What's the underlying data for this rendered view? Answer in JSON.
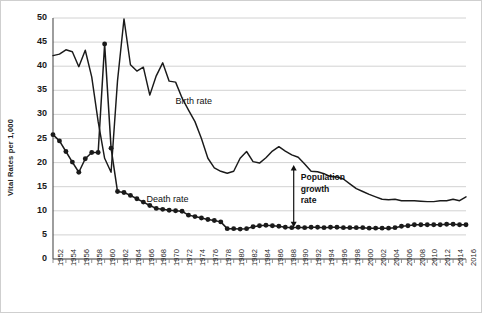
{
  "chart_data": {
    "type": "line",
    "title": "",
    "xlabel": "",
    "ylabel": "Vital Rates per 1,000",
    "ylim": [
      0,
      50
    ],
    "xlim": [
      1952,
      2016
    ],
    "yticks": [
      0,
      5,
      10,
      15,
      20,
      25,
      30,
      35,
      40,
      45,
      50
    ],
    "grid": "horizontal",
    "legend_position": "inline-annotations",
    "xticks": [
      1952,
      1954,
      1956,
      1958,
      1960,
      1962,
      1964,
      1966,
      1968,
      1970,
      1972,
      1974,
      1976,
      1978,
      1980,
      1982,
      1984,
      1986,
      1988,
      1990,
      1992,
      1994,
      1996,
      1998,
      2000,
      2002,
      2004,
      2006,
      2008,
      2010,
      2012,
      2014,
      2016
    ],
    "x": [
      1952,
      1953,
      1954,
      1955,
      1956,
      1957,
      1958,
      1959,
      1960,
      1961,
      1962,
      1963,
      1964,
      1965,
      1966,
      1967,
      1968,
      1969,
      1970,
      1971,
      1972,
      1973,
      1974,
      1975,
      1976,
      1977,
      1978,
      1979,
      1980,
      1981,
      1982,
      1983,
      1984,
      1985,
      1986,
      1987,
      1988,
      1989,
      1990,
      1991,
      1992,
      1993,
      1994,
      1995,
      1996,
      1997,
      1998,
      1999,
      2000,
      2001,
      2002,
      2003,
      2004,
      2005,
      2006,
      2007,
      2008,
      2009,
      2010,
      2011,
      2012,
      2013,
      2014,
      2015,
      2016
    ],
    "series": [
      {
        "name": "Birth rate",
        "marker": "none",
        "color": "#1a1a1a",
        "values": [
          42.2,
          42.5,
          43.4,
          43.0,
          39.9,
          43.3,
          37.8,
          28.5,
          20.9,
          18.0,
          37.0,
          49.8,
          40.3,
          39.0,
          39.8,
          34.0,
          38.0,
          40.7,
          36.9,
          36.7,
          33.4,
          30.9,
          28.5,
          25.0,
          20.9,
          18.9,
          18.2,
          17.8,
          18.2,
          20.9,
          22.3,
          20.2,
          19.9,
          21.0,
          22.4,
          23.3,
          22.4,
          21.6,
          21.1,
          19.7,
          18.2,
          18.1,
          17.7,
          17.1,
          17.0,
          16.6,
          15.6,
          14.6,
          14.0,
          13.4,
          12.9,
          12.4,
          12.3,
          12.4,
          12.1,
          12.1,
          12.1,
          12.0,
          11.9,
          11.9,
          12.1,
          12.1,
          12.4,
          12.1,
          12.9
        ]
      },
      {
        "name": "Death rate",
        "marker": "circle",
        "color": "#1a1a1a",
        "values": [
          25.8,
          24.5,
          22.3,
          20.1,
          18.0,
          20.8,
          22.1,
          22.1,
          44.6,
          23.0,
          14.0,
          13.8,
          13.2,
          12.5,
          11.8,
          11.1,
          10.5,
          10.3,
          10.1,
          10.0,
          9.9,
          9.1,
          8.8,
          8.5,
          8.2,
          8.0,
          7.7,
          6.3,
          6.3,
          6.2,
          6.3,
          6.7,
          6.9,
          7.0,
          6.9,
          6.8,
          6.6,
          6.5,
          6.6,
          6.5,
          6.6,
          6.6,
          6.5,
          6.6,
          6.6,
          6.5,
          6.5,
          6.5,
          6.5,
          6.4,
          6.4,
          6.4,
          6.4,
          6.5,
          6.8,
          6.9,
          7.1,
          7.1,
          7.1,
          7.1,
          7.1,
          7.2,
          7.2,
          7.1,
          7.1
        ]
      }
    ],
    "annotations": [
      {
        "name": "birth-rate-label",
        "text": "Birth rate",
        "x": 1971,
        "y": 32.5
      },
      {
        "name": "death-rate-label",
        "text": "Death rate",
        "x": 1966.5,
        "y": 12.2
      },
      {
        "name": "population-growth-rate-label",
        "text_lines": [
          "Population",
          "growth",
          "rate"
        ],
        "x": 1990.5,
        "y": 14.5,
        "arrow": {
          "x": 1989.3,
          "y_top": 19.5,
          "y_bottom": 6.6,
          "double_headed": true
        }
      }
    ]
  }
}
